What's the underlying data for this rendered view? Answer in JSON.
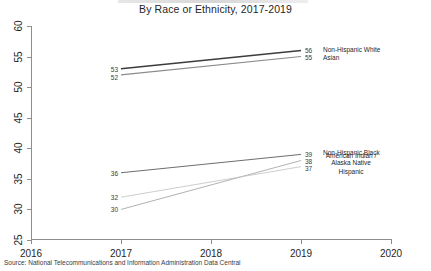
{
  "title": "By Race or Ethnicity, 2017-2019",
  "source": "Source: National Telecommunications and Information Administration Data Central",
  "axis": {
    "y_ticks": [
      "25",
      "30",
      "35",
      "40",
      "45",
      "50",
      "55",
      "60"
    ],
    "x_ticks": [
      "2016",
      "2017",
      "2018",
      "2019",
      "2020"
    ]
  },
  "labels": {
    "nhw_start": "53",
    "nhw_end": "56",
    "nhw_name": "Non-Hispanic White",
    "asian_start": "52",
    "asian_end": "55",
    "asian_name": "Asian",
    "nhb_start": "36",
    "nhb_end": "39",
    "nhb_name": "Non-Hispanic Black",
    "aian_start": "30",
    "aian_end": "38",
    "aian_name": "American Indian /\nAlaska Native",
    "hisp_start": "32",
    "hisp_end": "37",
    "hisp_name": "Hispanic"
  },
  "chart_data": {
    "type": "line",
    "title": "By Race or Ethnicity, 2017-2019",
    "xlabel": "",
    "ylabel": "",
    "x": [
      2017,
      2019
    ],
    "xlim": [
      2016,
      2020
    ],
    "ylim": [
      25,
      60
    ],
    "yticks": [
      25,
      30,
      35,
      40,
      45,
      50,
      55,
      60
    ],
    "xticks": [
      2016,
      2017,
      2018,
      2019,
      2020
    ],
    "grid": false,
    "legend": "right-inline-labels",
    "series": [
      {
        "name": "Non-Hispanic White",
        "values": [
          53,
          56
        ],
        "color": "#3c3c3c"
      },
      {
        "name": "Asian",
        "values": [
          52,
          55
        ],
        "color": "#8a8a8a"
      },
      {
        "name": "Non-Hispanic Black",
        "values": [
          36,
          39
        ],
        "color": "#6e6e6e"
      },
      {
        "name": "American Indian / Alaska Native",
        "values": [
          30,
          38
        ],
        "color": "#a8a8a8"
      },
      {
        "name": "Hispanic",
        "values": [
          32,
          37
        ],
        "color": "#c0c0c0"
      }
    ]
  }
}
